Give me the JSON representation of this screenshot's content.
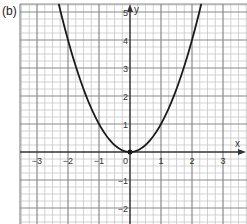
{
  "panel_label": "(b)",
  "chart_data": {
    "type": "line",
    "title": "",
    "function": "y = x^2",
    "xlabel": "x",
    "ylabel": "y",
    "xlim": [
      -3.5,
      3.5
    ],
    "ylim": [
      -2.5,
      5.3
    ],
    "grid": true,
    "minor_grid_per_unit": 4,
    "x_ticks": [
      -3,
      -2,
      -1,
      1,
      2,
      3
    ],
    "x_tick_labels": [
      "−3",
      "−2",
      "−1",
      "1",
      "2",
      "3"
    ],
    "y_ticks": [
      -2,
      -1,
      1,
      2,
      3,
      4,
      5
    ],
    "y_tick_labels": [
      "−2",
      "−1",
      "1",
      "2",
      "3",
      "4",
      "5"
    ],
    "origin_label": "0",
    "marked_point": [
      0,
      0
    ],
    "series": [
      {
        "name": "y = x²",
        "x": [
          -2.3,
          -2,
          -1.5,
          -1,
          -0.5,
          0,
          0.5,
          1,
          1.5,
          2,
          2.3
        ],
        "y": [
          5.29,
          4,
          2.25,
          1,
          0.25,
          0,
          0.25,
          1,
          2.25,
          4,
          5.29
        ]
      }
    ]
  },
  "layout": {
    "origin_px": [
      130,
      152
    ],
    "unit_x_px": 31,
    "unit_y_px": 28,
    "plot_left_px": 20,
    "plot_right_px": 247,
    "plot_top_px": 4,
    "plot_bottom_px": 224
  },
  "colors": {
    "major_grid": "#8a8a8a",
    "minor_grid": "#c8c8c8",
    "axis": "#333333",
    "curve": "#1a1a1a"
  }
}
